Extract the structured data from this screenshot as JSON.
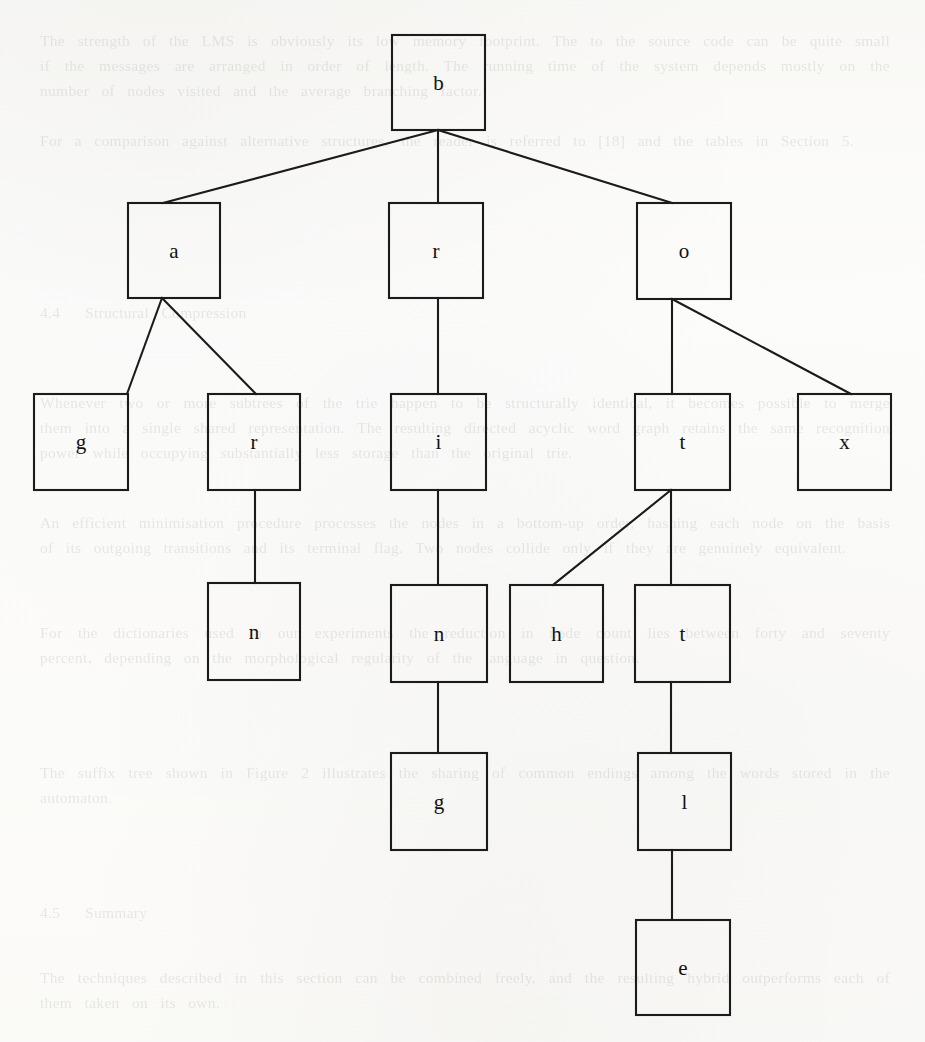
{
  "page": {
    "kind": "scanned-book-page-figure",
    "width": 925,
    "height": 1042,
    "background_color": "#fdfdfc",
    "ink_color": "#1b1b1b"
  },
  "diagram": {
    "type": "tree",
    "name": "character-trie",
    "box_size": {
      "width": 94,
      "height": 96
    },
    "nodes": [
      {
        "id": "n0",
        "label": "b",
        "x": 392,
        "y": 35,
        "w": 93,
        "h": 95,
        "level": 0
      },
      {
        "id": "n1",
        "label": "a",
        "x": 128,
        "y": 203,
        "w": 92,
        "h": 95,
        "level": 1
      },
      {
        "id": "n2",
        "label": "r",
        "x": 389,
        "y": 203,
        "w": 94,
        "h": 95,
        "level": 1
      },
      {
        "id": "n3",
        "label": "o",
        "x": 637,
        "y": 203,
        "w": 94,
        "h": 96,
        "level": 1
      },
      {
        "id": "n4",
        "label": "g",
        "x": 34,
        "y": 394,
        "w": 94,
        "h": 96,
        "level": 2
      },
      {
        "id": "n5",
        "label": "r",
        "x": 208,
        "y": 394,
        "w": 92,
        "h": 96,
        "level": 2
      },
      {
        "id": "n6",
        "label": "i",
        "x": 391,
        "y": 394,
        "w": 95,
        "h": 96,
        "level": 2
      },
      {
        "id": "n7",
        "label": "t",
        "x": 635,
        "y": 394,
        "w": 95,
        "h": 96,
        "level": 2
      },
      {
        "id": "n8",
        "label": "x",
        "x": 798,
        "y": 394,
        "w": 93,
        "h": 96,
        "level": 2
      },
      {
        "id": "n9",
        "label": "n",
        "x": 208,
        "y": 583,
        "w": 92,
        "h": 97,
        "level": 3
      },
      {
        "id": "n10",
        "label": "n",
        "x": 391,
        "y": 585,
        "w": 96,
        "h": 97,
        "level": 3
      },
      {
        "id": "n11",
        "label": "h",
        "x": 510,
        "y": 585,
        "w": 93,
        "h": 97,
        "level": 3
      },
      {
        "id": "n12",
        "label": "t",
        "x": 635,
        "y": 585,
        "w": 95,
        "h": 97,
        "level": 3
      },
      {
        "id": "n13",
        "label": "g",
        "x": 391,
        "y": 753,
        "w": 96,
        "h": 97,
        "level": 4
      },
      {
        "id": "n14",
        "label": "l",
        "x": 638,
        "y": 753,
        "w": 93,
        "h": 97,
        "level": 4
      },
      {
        "id": "n15",
        "label": "e",
        "x": 636,
        "y": 920,
        "w": 94,
        "h": 95,
        "level": 5
      }
    ],
    "edges": [
      {
        "from": "n0",
        "to": "n1",
        "x1": 438,
        "y1": 130,
        "x2": 163,
        "y2": 203
      },
      {
        "from": "n0",
        "to": "n2",
        "x1": 438,
        "y1": 130,
        "x2": 438,
        "y2": 203
      },
      {
        "from": "n0",
        "to": "n3",
        "x1": 438,
        "y1": 130,
        "x2": 672,
        "y2": 203
      },
      {
        "from": "n1",
        "to": "n4",
        "x1": 162,
        "y1": 298,
        "x2": 127,
        "y2": 394
      },
      {
        "from": "n1",
        "to": "n5",
        "x1": 162,
        "y1": 298,
        "x2": 256,
        "y2": 394
      },
      {
        "from": "n2",
        "to": "n6",
        "x1": 438,
        "y1": 298,
        "x2": 438,
        "y2": 394
      },
      {
        "from": "n3",
        "to": "n7",
        "x1": 672,
        "y1": 299,
        "x2": 672,
        "y2": 394
      },
      {
        "from": "n3",
        "to": "n8",
        "x1": 672,
        "y1": 299,
        "x2": 851,
        "y2": 394
      },
      {
        "from": "n5",
        "to": "n9",
        "x1": 255,
        "y1": 490,
        "x2": 255,
        "y2": 583
      },
      {
        "from": "n6",
        "to": "n10",
        "x1": 438,
        "y1": 490,
        "x2": 438,
        "y2": 585
      },
      {
        "from": "n7",
        "to": "n11",
        "x1": 671,
        "y1": 490,
        "x2": 553,
        "y2": 585
      },
      {
        "from": "n7",
        "to": "n12",
        "x1": 671,
        "y1": 490,
        "x2": 671,
        "y2": 585
      },
      {
        "from": "n10",
        "to": "n13",
        "x1": 438,
        "y1": 682,
        "x2": 438,
        "y2": 753
      },
      {
        "from": "n12",
        "to": "n14",
        "x1": 671,
        "y1": 682,
        "x2": 671,
        "y2": 753
      },
      {
        "from": "n14",
        "to": "n15",
        "x1": 672,
        "y1": 850,
        "x2": 672,
        "y2": 920
      }
    ]
  },
  "bleed_through": {
    "note": "faint mirrored text showing through the scanned page",
    "blocks": [
      {
        "x": 40,
        "y": 28,
        "w": 850,
        "text": "The  strength  of  the  LMS  is  obviously  its  low  memory  footprint.  The  to  the  source  code  can  be  quite  small  if  the  messages  are  arranged  in  order  of  length.  The  running  time  of  the  system  depends  mostly  on  the  number  of  nodes  visited  and  the  average  branching  factor."
      },
      {
        "x": 40,
        "y": 128,
        "w": 850,
        "text": "For  a  comparison  against  alternative  structures,  the  reader  is  referred  to  [18]  and  the  tables  in  Section  5."
      },
      {
        "x": 40,
        "y": 300,
        "w": 850,
        "text": "4.4    Structural  Compression"
      },
      {
        "x": 40,
        "y": 390,
        "w": 850,
        "text": "Whenever  two  or  more  subtrees  of  the  trie  happen  to  be  structurally  identical,  it  becomes  possible  to  merge  them  into  a  single  shared  representation.  The  resulting  directed  acyclic  word  graph  retains  the  same  recognition  power  while  occupying  substantially  less  storage  than  the  original  trie."
      },
      {
        "x": 40,
        "y": 510,
        "w": 850,
        "text": "An  efficient  minimisation  procedure  processes  the  nodes  in  a  bottom-up  order,  hashing  each  node  on  the  basis  of  its  outgoing  transitions  and  its  terminal  flag.  Two  nodes  collide  only  if  they  are  genuinely  equivalent."
      },
      {
        "x": 40,
        "y": 620,
        "w": 850,
        "text": "For  the  dictionaries  used  in  our  experiments  the  reduction  in  node  count  lies  between  forty  and  seventy  percent,  depending  on  the  morphological  regularity  of  the  language  in  question."
      },
      {
        "x": 40,
        "y": 760,
        "w": 850,
        "text": "The  suffix  tree  shown  in  Figure  2  illustrates  the  sharing  of  common  endings  among  the  words  stored  in  the  automaton."
      },
      {
        "x": 40,
        "y": 900,
        "w": 850,
        "text": "4.5    Summary"
      },
      {
        "x": 40,
        "y": 965,
        "w": 850,
        "text": "The  techniques  described  in  this  section  can  be  combined  freely,  and  the  resulting  hybrid  outperforms  each  of  them  taken  on  its  own."
      }
    ]
  }
}
